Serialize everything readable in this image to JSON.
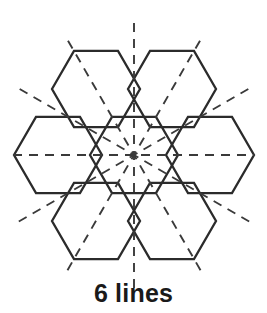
{
  "figure": {
    "title": "6 lines",
    "caption": "6 lines",
    "shape_name": "hexagon-flower",
    "symmetry_line_count": 6,
    "colors": {
      "background": "#ffffff",
      "outline": "#2b2b2b",
      "symmetry_line": "#3a3a3a",
      "caption_text": "#1a1a1a"
    },
    "center": {
      "x": 134,
      "y": 155
    },
    "hexagon": {
      "orientation": "flat-top",
      "circumradius": 44,
      "count": 7
    },
    "tile_centers": [
      {
        "name": "center",
        "x": 134,
        "y": 155
      },
      {
        "name": "upper-right",
        "x": 172,
        "y": 89
      },
      {
        "name": "right",
        "x": 210,
        "y": 155
      },
      {
        "name": "lower-right",
        "x": 172,
        "y": 221
      },
      {
        "name": "lower-left",
        "x": 96,
        "y": 221
      },
      {
        "name": "left",
        "x": 58,
        "y": 155
      },
      {
        "name": "upper-left",
        "x": 96,
        "y": 89
      }
    ],
    "symmetry_lines": [
      {
        "name": "vertical",
        "angle_deg": 90,
        "half_length": 133
      },
      {
        "name": "horizontal",
        "angle_deg": 0,
        "half_length": 121
      },
      {
        "name": "diagonal-60",
        "angle_deg": 60,
        "half_length": 133
      },
      {
        "name": "diagonal-120",
        "angle_deg": 120,
        "half_length": 133
      },
      {
        "name": "diagonal-30",
        "angle_deg": 30,
        "half_length": 133
      },
      {
        "name": "diagonal-150",
        "angle_deg": 150,
        "half_length": 133
      }
    ]
  }
}
